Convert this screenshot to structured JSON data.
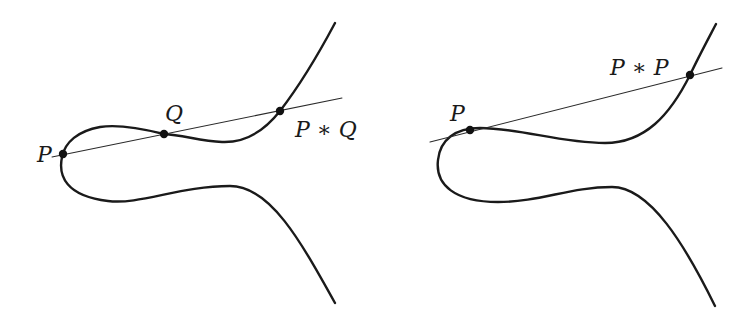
{
  "figures": [
    {
      "name": "addition-of-distinct-points",
      "labels": {
        "p": "P",
        "q": "Q",
        "result": "P ∗ Q"
      },
      "points": {
        "p": [
          63,
          154
        ],
        "q": [
          164,
          134
        ],
        "result": [
          280,
          111
        ]
      }
    },
    {
      "name": "doubling-a-point",
      "labels": {
        "p": "P",
        "result": "P ∗ P"
      },
      "points": {
        "p": [
          470,
          130
        ],
        "result": [
          690,
          75
        ]
      }
    }
  ],
  "colors": {
    "curve": "#1a1a1a",
    "line": "#2a2a2a",
    "background": "#ffffff"
  }
}
